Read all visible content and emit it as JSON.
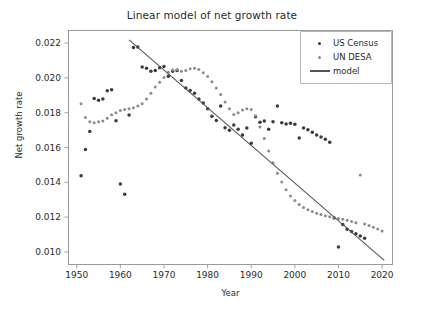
{
  "chart_data": {
    "type": "scatter",
    "title": "Linear model of net growth rate",
    "xlabel": "Year",
    "ylabel": "Net growth rate",
    "xlim": [
      1948,
      2022.5
    ],
    "ylim": [
      0.00925,
      0.02275
    ],
    "xticks": [
      1950,
      1960,
      1970,
      1980,
      1990,
      2000,
      2010,
      2020
    ],
    "xticklabels": [
      "1950",
      "1960",
      "1970",
      "1980",
      "1990",
      "2000",
      "2010",
      "2020"
    ],
    "yticks": [
      0.01,
      0.012,
      0.014,
      0.016,
      0.018,
      0.02,
      0.022
    ],
    "yticklabels": [
      "0.010",
      "0.012",
      "0.014",
      "0.016",
      "0.018",
      "0.020",
      "0.022"
    ],
    "grid": false,
    "legend_position": "upper right",
    "colors": {
      "us_census": "#3b3b3b",
      "un_desa": "#8c8c8c",
      "model": "#555555",
      "axis": "#9a9a9a",
      "text": "#2b2b2b",
      "background": "#ffffff"
    },
    "series": [
      {
        "name": "US Census",
        "marker": "dot",
        "color": "#3b3b3b",
        "points": [
          [
            1951,
            0.01437
          ],
          [
            1952,
            0.01588
          ],
          [
            1953,
            0.01692
          ],
          [
            1954,
            0.01882
          ],
          [
            1955,
            0.01872
          ],
          [
            1956,
            0.01879
          ],
          [
            1957,
            0.01926
          ],
          [
            1958,
            0.01932
          ],
          [
            1959,
            0.01754
          ],
          [
            1960,
            0.0139
          ],
          [
            1961,
            0.01332
          ],
          [
            1962,
            0.01787
          ],
          [
            1963,
            0.02175
          ],
          [
            1964,
            0.02178
          ],
          [
            1965,
            0.02062
          ],
          [
            1966,
            0.02055
          ],
          [
            1967,
            0.02038
          ],
          [
            1968,
            0.02043
          ],
          [
            1969,
            0.02058
          ],
          [
            1970,
            0.02065
          ],
          [
            1971,
            0.0201
          ],
          [
            1972,
            0.02038
          ],
          [
            1973,
            0.02042
          ],
          [
            1974,
            0.01985
          ],
          [
            1975,
            0.01942
          ],
          [
            1976,
            0.01927
          ],
          [
            1977,
            0.01912
          ],
          [
            1978,
            0.01878
          ],
          [
            1979,
            0.01855
          ],
          [
            1980,
            0.01823
          ],
          [
            1981,
            0.0178
          ],
          [
            1982,
            0.01755
          ],
          [
            1983,
            0.01838
          ],
          [
            1984,
            0.01714
          ],
          [
            1985,
            0.01699
          ],
          [
            1986,
            0.01729
          ],
          [
            1987,
            0.01705
          ],
          [
            1988,
            0.01672
          ],
          [
            1989,
            0.01712
          ],
          [
            1990,
            0.01625
          ],
          [
            1991,
            0.01777
          ],
          [
            1992,
            0.01745
          ],
          [
            1993,
            0.01752
          ],
          [
            1994,
            0.01705
          ],
          [
            1995,
            0.01748
          ],
          [
            1996,
            0.01838
          ],
          [
            1997,
            0.01742
          ],
          [
            1998,
            0.01735
          ],
          [
            1999,
            0.0174
          ],
          [
            2000,
            0.01733
          ],
          [
            2001,
            0.01655
          ],
          [
            2002,
            0.01712
          ],
          [
            2003,
            0.01702
          ],
          [
            2004,
            0.01688
          ],
          [
            2005,
            0.01672
          ],
          [
            2006,
            0.01661
          ],
          [
            2007,
            0.01648
          ],
          [
            2008,
            0.0163
          ],
          [
            2009,
            0.01195
          ],
          [
            2010,
            0.01028
          ],
          [
            2011,
            0.01158
          ],
          [
            2012,
            0.0113
          ],
          [
            2013,
            0.01118
          ],
          [
            2014,
            0.01105
          ],
          [
            2015,
            0.01092
          ],
          [
            2016,
            0.01078
          ]
        ]
      },
      {
        "name": "UN DESA",
        "marker": "dot",
        "color": "#8c8c8c",
        "points": [
          [
            1951,
            0.01852
          ],
          [
            1952,
            0.01772
          ],
          [
            1953,
            0.01748
          ],
          [
            1954,
            0.01742
          ],
          [
            1955,
            0.01748
          ],
          [
            1956,
            0.01752
          ],
          [
            1957,
            0.01768
          ],
          [
            1958,
            0.01788
          ],
          [
            1959,
            0.018
          ],
          [
            1960,
            0.01812
          ],
          [
            1961,
            0.01818
          ],
          [
            1962,
            0.01822
          ],
          [
            1963,
            0.01828
          ],
          [
            1964,
            0.01838
          ],
          [
            1965,
            0.01852
          ],
          [
            1966,
            0.01878
          ],
          [
            1967,
            0.01912
          ],
          [
            1968,
            0.01948
          ],
          [
            1969,
            0.01975
          ],
          [
            1970,
            0.02002
          ],
          [
            1971,
            0.02032
          ],
          [
            1972,
            0.02045
          ],
          [
            1973,
            0.02048
          ],
          [
            1974,
            0.02038
          ],
          [
            1975,
            0.02042
          ],
          [
            1976,
            0.02052
          ],
          [
            1977,
            0.02055
          ],
          [
            1978,
            0.02048
          ],
          [
            1979,
            0.0203
          ],
          [
            1980,
            0.02008
          ],
          [
            1981,
            0.01978
          ],
          [
            1982,
            0.01942
          ],
          [
            1983,
            0.01905
          ],
          [
            1984,
            0.01862
          ],
          [
            1985,
            0.01822
          ],
          [
            1986,
            0.0179
          ],
          [
            1987,
            0.018
          ],
          [
            1988,
            0.01815
          ],
          [
            1989,
            0.01822
          ],
          [
            1990,
            0.01818
          ],
          [
            1991,
            0.01782
          ],
          [
            1992,
            0.01718
          ],
          [
            1993,
            0.01652
          ],
          [
            1994,
            0.0158
          ],
          [
            1995,
            0.01512
          ],
          [
            1996,
            0.01452
          ],
          [
            1997,
            0.01402
          ],
          [
            1998,
            0.01358
          ],
          [
            1999,
            0.01322
          ],
          [
            2000,
            0.01295
          ],
          [
            2001,
            0.01272
          ],
          [
            2002,
            0.01255
          ],
          [
            2003,
            0.01242
          ],
          [
            2004,
            0.01232
          ],
          [
            2005,
            0.01222
          ],
          [
            2006,
            0.01215
          ],
          [
            2007,
            0.01208
          ],
          [
            2008,
            0.01202
          ],
          [
            2009,
            0.01198
          ],
          [
            2010,
            0.01192
          ],
          [
            2011,
            0.01188
          ],
          [
            2012,
            0.01182
          ],
          [
            2013,
            0.01175
          ],
          [
            2014,
            0.01168
          ],
          [
            2015,
            0.01442
          ],
          [
            2016,
            0.0116
          ],
          [
            2017,
            0.01152
          ],
          [
            2018,
            0.01142
          ],
          [
            2019,
            0.01132
          ],
          [
            2020,
            0.0112
          ]
        ]
      }
    ],
    "model": {
      "name": "model",
      "color": "#555555",
      "x_start": 1962,
      "y_start": 0.02218,
      "x_end": 2020.5,
      "y_end": 0.00952
    },
    "legend": [
      {
        "label": "US Census",
        "type": "dot",
        "color": "#3b3b3b"
      },
      {
        "label": "UN DESA",
        "type": "dot",
        "color": "#8c8c8c"
      },
      {
        "label": "model",
        "type": "line",
        "color": "#555555"
      }
    ]
  }
}
